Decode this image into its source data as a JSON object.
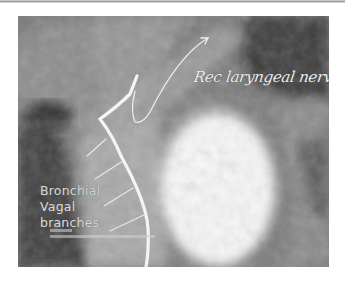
{
  "figure": {
    "type": "annotated surgical photograph (grayscale)",
    "annotations": {
      "recurrent_nerve_label": "Rec laryngeal nerve",
      "bronchial_label": [
        "Bronchial",
        "Vagal",
        "branches"
      ],
      "credit_text": "illegible small attribution text"
    },
    "drawn_lines": {
      "vagus_trunk": "thick white line, descending then curving down",
      "recurrent_nerve": "thin white line looping up with arrowhead to label",
      "bronchial_branches": "four short thin white lines branching left from the vagus"
    }
  }
}
